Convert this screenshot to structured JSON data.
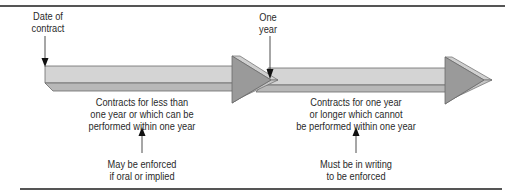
{
  "diagram": {
    "type": "timeline",
    "markers": [
      {
        "id": "start",
        "lines": [
          "Date of",
          "contract"
        ]
      },
      {
        "id": "one-year",
        "lines": [
          "One",
          "year"
        ]
      }
    ],
    "segments": [
      {
        "id": "less-than-one-year",
        "description": [
          "Contracts for less than",
          "one year or which can be",
          "performed within one year"
        ],
        "rule": [
          "May be enforced",
          "if oral or implied"
        ]
      },
      {
        "id": "one-year-or-longer",
        "description": [
          "Contracts for one year",
          "or longer which cannot",
          "be performed within one year"
        ],
        "rule": [
          "Must be in writing",
          "to be enforced"
        ]
      }
    ],
    "colors": {
      "bar_top": "#d4d4d4",
      "bar_bottom": "#b8b8b8",
      "arrowhead": "#9a9a9a",
      "arrowhead_bevel": "#d0d0d0",
      "outline": "#6a6a6a",
      "rule_line": "#555555"
    }
  }
}
